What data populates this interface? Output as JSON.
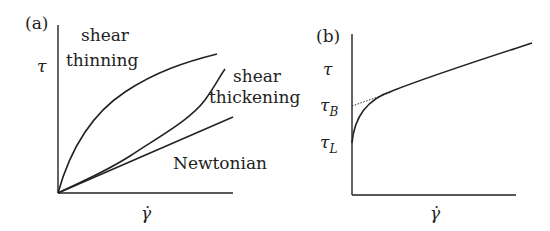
{
  "panel_a": {
    "label": "(a)",
    "y_axis": "τ",
    "x_axis": "γ̇",
    "curves": {
      "thinning_line1": "shear",
      "thinning_line2": "thinning",
      "thickening_line1": "shear",
      "thickening_line2": "thickening",
      "newtonian": "Newtonian"
    }
  },
  "panel_b": {
    "label": "(b)",
    "y_axis": "τ",
    "x_axis": "γ̇",
    "tau_b": "τ",
    "tau_b_sub": "B",
    "tau_l": "τ",
    "tau_l_sub": "L"
  }
}
